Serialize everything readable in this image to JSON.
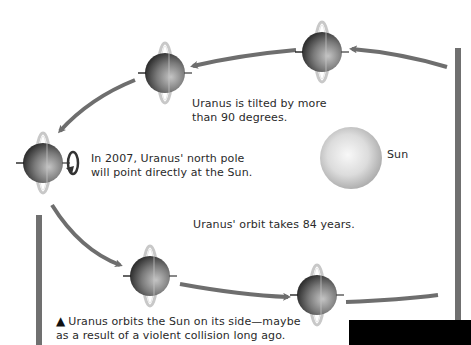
{
  "diagram": {
    "labels": {
      "tilt": [
        "Uranus is tilted by more",
        "than 90 degrees."
      ],
      "pole": [
        "In 2007, Uranus' north pole",
        "will point directly at the Sun."
      ],
      "sun": "Sun",
      "period": "Uranus' orbit takes 84 years.",
      "caption_marker": "▲",
      "caption": [
        "Uranus orbits the Sun on its side—maybe",
        "as a result of a violent collision long ago."
      ]
    },
    "nodes": [
      {
        "id": "uranus-top-right",
        "x": 325,
        "y": 50,
        "type": "planet"
      },
      {
        "id": "uranus-top-left",
        "x": 166,
        "y": 74,
        "type": "planet"
      },
      {
        "id": "uranus-left",
        "x": 43,
        "y": 163,
        "type": "planet",
        "rotation_arrow": true
      },
      {
        "id": "uranus-bottom-left",
        "x": 150,
        "y": 275,
        "type": "planet"
      },
      {
        "id": "uranus-bottom-right",
        "x": 317,
        "y": 294,
        "type": "planet"
      },
      {
        "id": "sun",
        "x": 351,
        "y": 158,
        "type": "star"
      }
    ],
    "colors": {
      "orbit_arrow": "#6e6e6e",
      "planet_dark": "#3a3a3a",
      "planet_light": "#b5b5b5",
      "ring": "#c8c8c8",
      "sun_center": "#f6f6f6",
      "sun_edge": "#a8a8a8",
      "text": "#2a2a2a"
    }
  }
}
